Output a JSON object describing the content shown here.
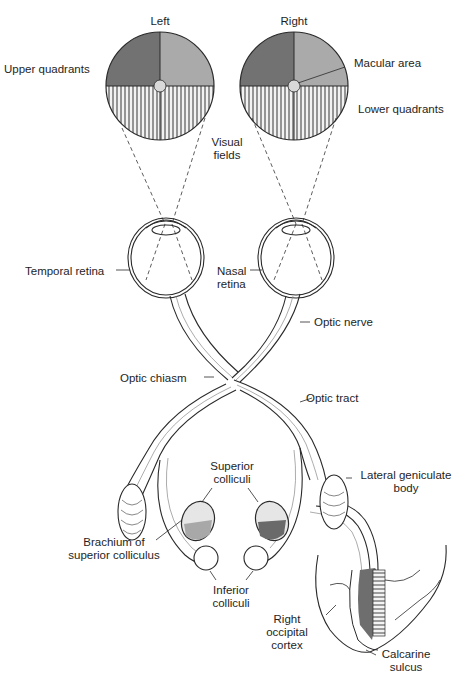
{
  "diagram": {
    "type": "anatomical-pathway"
  },
  "visual_fields": {
    "left_title": "Left",
    "right_title": "Right",
    "caption_line1": "Visual",
    "caption_line2": "fields",
    "quadrant_colors": {
      "upper_temporal": "#6e6e6e",
      "upper_nasal": "#a9a9a9",
      "lower_pattern": "vertical-stripes",
      "stripe_color": "#5a5a5a"
    }
  },
  "labels": {
    "upper_quadrants": "Upper quadrants",
    "macular_area": "Macular area",
    "lower_quadrants": "Lower quadrants",
    "temporal_retina": "Temporal retina",
    "nasal_retina_line1": "Nasal",
    "nasal_retina_line2": "retina",
    "optic_nerve": "Optic nerve",
    "optic_chiasm": "Optic chiasm",
    "optic_tract": "Optic tract",
    "superior_colliculi_line1": "Superior",
    "superior_colliculi_line2": "colliculi",
    "lateral_geniculate_line1": "Lateral geniculate",
    "lateral_geniculate_line2": "body",
    "brachium_line1": "Brachium of",
    "brachium_line2": "superior colliculus",
    "inferior_colliculi_line1": "Inferior",
    "inferior_colliculi_line2": "colliculi",
    "occipital_line1": "Right",
    "occipital_line2": "occipital",
    "occipital_line3": "cortex",
    "calcarine_line1": "Calcarine",
    "calcarine_line2": "sulcus"
  },
  "colors": {
    "line": "#2a2a2a",
    "dark_fill": "#6e6e6e",
    "light_fill": "#b0b0b0",
    "background": "#ffffff"
  }
}
